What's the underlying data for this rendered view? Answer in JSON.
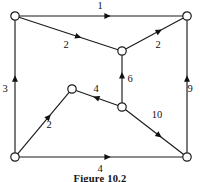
{
  "figure": {
    "caption": "Figure 10.2",
    "background_color": "#ffffff",
    "ink_color": "#1a1a1a",
    "node_fill": "#ffffff",
    "nodes": [
      {
        "id": "top-left",
        "label": "",
        "x": 15,
        "y": 16
      },
      {
        "id": "top-right",
        "label": "",
        "x": 187,
        "y": 16
      },
      {
        "id": "center",
        "label": "",
        "x": 122,
        "y": 51
      },
      {
        "id": "peak",
        "label": "",
        "x": 72,
        "y": 89
      },
      {
        "id": "lower-middle",
        "label": "",
        "x": 122,
        "y": 107
      },
      {
        "id": "bottom-left",
        "label": "",
        "x": 15,
        "y": 157
      },
      {
        "id": "bottom-right",
        "label": "",
        "x": 187,
        "y": 157
      }
    ],
    "edges": [
      {
        "id": "top-edge",
        "from": "top-left",
        "to": "top-right",
        "weight": "1",
        "label_x": 100,
        "label_y": 9,
        "arrow_t": 0.54,
        "direction": "right"
      },
      {
        "id": "upper-left-diagonal",
        "from": "top-left",
        "to": "center",
        "weight": "2",
        "label_x": 66,
        "label_y": 48,
        "arrow_t": 0.6,
        "direction": "down-right"
      },
      {
        "id": "upper-right-diagonal",
        "from": "center",
        "to": "top-right",
        "weight": "2",
        "label_x": 158,
        "label_y": 48,
        "arrow_t": 0.58,
        "direction": "up-right"
      },
      {
        "id": "center-vertical",
        "from": "lower-middle",
        "to": "center",
        "weight": "6",
        "label_x": 130,
        "label_y": 82,
        "arrow_t": 0.58,
        "direction": "up"
      },
      {
        "id": "left-vertical",
        "from": "bottom-left",
        "to": "top-left",
        "weight": "3",
        "label_x": 5,
        "label_y": 92,
        "arrow_t": 0.56,
        "direction": "up"
      },
      {
        "id": "right-vertical",
        "from": "bottom-right",
        "to": "top-right",
        "weight": "9",
        "label_x": 190,
        "label_y": 92,
        "arrow_t": 0.56,
        "direction": "up"
      },
      {
        "id": "middle-horizontal",
        "from": "lower-middle",
        "to": "peak",
        "weight": "4",
        "label_x": 96,
        "label_y": 92,
        "arrow_t": 0.52,
        "direction": "left"
      },
      {
        "id": "lower-left-diagonal",
        "from": "bottom-left",
        "to": "peak",
        "weight": "2",
        "label_x": 49,
        "label_y": 128,
        "arrow_t": 0.6,
        "direction": "up-right"
      },
      {
        "id": "lower-right-diagonal",
        "from": "lower-middle",
        "to": "bottom-right",
        "weight": "10",
        "label_x": 157,
        "label_y": 118,
        "arrow_t": 0.58,
        "direction": "down-right"
      },
      {
        "id": "bottom-edge",
        "from": "bottom-left",
        "to": "bottom-right",
        "weight": "4",
        "label_x": 100,
        "label_y": 172,
        "arrow_t": 0.54,
        "direction": "right"
      }
    ]
  }
}
